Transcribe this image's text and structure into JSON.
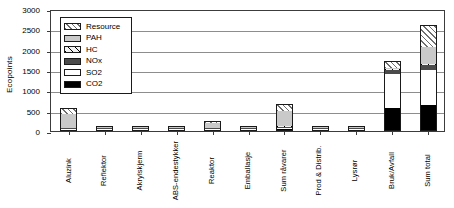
{
  "chart_data": {
    "type": "bar",
    "title": "",
    "xlabel": "",
    "ylabel": "Ecopoints",
    "ylim": [
      0,
      3000
    ],
    "ytick_values": [
      0,
      500,
      1000,
      1500,
      2000,
      2500,
      3000
    ],
    "ytick_labels": [
      "0",
      "500",
      "1000",
      "1500",
      "2000",
      "2500",
      "3000"
    ],
    "grid": true,
    "stacked": true,
    "legend_position": "upper-left-inside",
    "categories": [
      "Aluzink",
      "Reflektor",
      "Akrylskjerm",
      "ABS-endestykker",
      "Reaktor",
      "Emballasje",
      "Sum råvarer",
      "Prod & Distrib.",
      "Lysrør",
      "Bruk/Avfall",
      "Sum total"
    ],
    "series": [
      {
        "name": "CO2",
        "key": "co2",
        "swatch": "black",
        "values": [
          10,
          20,
          10,
          5,
          5,
          3,
          55,
          10,
          25,
          560,
          640
        ]
      },
      {
        "name": "SO2",
        "key": "so2",
        "swatch": "white",
        "values": [
          10,
          5,
          5,
          3,
          5,
          2,
          30,
          5,
          5,
          830,
          865
        ]
      },
      {
        "name": "NOx",
        "key": "nox",
        "swatch": "dark-gray",
        "values": [
          5,
          3,
          3,
          2,
          3,
          1,
          17,
          3,
          3,
          110,
          130
        ]
      },
      {
        "name": "HC",
        "key": "hc",
        "swatch": "sparse-hatch",
        "values": [
          3,
          2,
          2,
          1,
          2,
          1,
          11,
          2,
          2,
          15,
          20
        ]
      },
      {
        "name": "PAH",
        "key": "pah",
        "swatch": "light-gray",
        "values": [
          330,
          2,
          2,
          1,
          120,
          1,
          370,
          2,
          2,
          20,
          400
        ]
      },
      {
        "name": "Resource",
        "key": "res",
        "swatch": "diagonal-hatch",
        "values": [
          150,
          3,
          3,
          2,
          50,
          2,
          175,
          3,
          3,
          175,
          545
        ]
      }
    ],
    "totals": [
      508,
      35,
      25,
      14,
      185,
      10,
      658,
      25,
      40,
      1710,
      2600
    ],
    "colors": {
      "co2": "#000000",
      "so2": "#ffffff",
      "nox": "#4a4a4a",
      "hc": "#f2f2f2",
      "pah": "#c9c9c9",
      "res": "#ffffff",
      "axis": "#3c3c3c",
      "grid": "#8d8d8d",
      "outline": "#1a1a1a"
    }
  },
  "legend": {
    "items": [
      {
        "label": "Resource",
        "key": "res"
      },
      {
        "label": "PAH",
        "key": "pah"
      },
      {
        "label": "HC",
        "key": "hc"
      },
      {
        "label": "NOx",
        "key": "nox"
      },
      {
        "label": "SO2",
        "key": "so2"
      },
      {
        "label": "CO2",
        "key": "co2"
      }
    ]
  }
}
